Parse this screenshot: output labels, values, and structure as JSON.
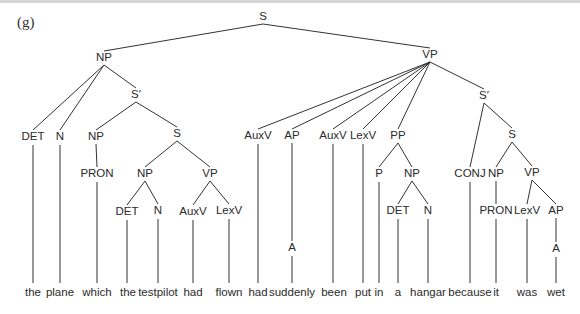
{
  "figure": {
    "label": "(g)",
    "type": "syntax-tree",
    "sentence": "the plane which the testpilot had flown had suddenly been put in a hangar because it was wet"
  },
  "nodes": [
    {
      "id": "S0",
      "label": "S",
      "x": 263,
      "y": 20
    },
    {
      "id": "NP0",
      "label": "NP",
      "x": 104,
      "y": 61
    },
    {
      "id": "VP0",
      "label": "VP",
      "x": 430,
      "y": 58
    },
    {
      "id": "DET0",
      "label": "DET",
      "x": 33,
      "y": 140
    },
    {
      "id": "N0",
      "label": "N",
      "x": 60,
      "y": 140
    },
    {
      "id": "Sb0",
      "label": "S′",
      "x": 136,
      "y": 98
    },
    {
      "id": "NP1",
      "label": "NP",
      "x": 96,
      "y": 140
    },
    {
      "id": "PRON0",
      "label": "PRON",
      "x": 97,
      "y": 177
    },
    {
      "id": "S1",
      "label": "S",
      "x": 177,
      "y": 137
    },
    {
      "id": "NP2",
      "label": "NP",
      "x": 145,
      "y": 177
    },
    {
      "id": "VP1",
      "label": "VP",
      "x": 210,
      "y": 177
    },
    {
      "id": "DET1",
      "label": "DET",
      "x": 127,
      "y": 215
    },
    {
      "id": "N1",
      "label": "N",
      "x": 158,
      "y": 214
    },
    {
      "id": "AuxV0",
      "label": "AuxV",
      "x": 193,
      "y": 215
    },
    {
      "id": "LexV0",
      "label": "LexV",
      "x": 229,
      "y": 214
    },
    {
      "id": "AuxV1",
      "label": "AuxV",
      "x": 258,
      "y": 139
    },
    {
      "id": "AP0",
      "label": "AP",
      "x": 292,
      "y": 139
    },
    {
      "id": "A0",
      "label": "A",
      "x": 292,
      "y": 251
    },
    {
      "id": "AuxV2",
      "label": "AuxV",
      "x": 333,
      "y": 139
    },
    {
      "id": "LexV1",
      "label": "LexV",
      "x": 363,
      "y": 139
    },
    {
      "id": "PP0",
      "label": "PP",
      "x": 398,
      "y": 139
    },
    {
      "id": "P0",
      "label": "P",
      "x": 379,
      "y": 177
    },
    {
      "id": "NP3",
      "label": "NP",
      "x": 412,
      "y": 177
    },
    {
      "id": "DET2",
      "label": "DET",
      "x": 398,
      "y": 214
    },
    {
      "id": "N2",
      "label": "N",
      "x": 428,
      "y": 214
    },
    {
      "id": "Sb1",
      "label": "S′",
      "x": 484,
      "y": 99
    },
    {
      "id": "S2",
      "label": "S",
      "x": 512,
      "y": 138
    },
    {
      "id": "CONJ0",
      "label": "CONJ",
      "x": 470,
      "y": 177
    },
    {
      "id": "NP4",
      "label": "NP",
      "x": 496,
      "y": 177
    },
    {
      "id": "PRON1",
      "label": "PRON",
      "x": 496,
      "y": 214
    },
    {
      "id": "VP2",
      "label": "VP",
      "x": 532,
      "y": 176
    },
    {
      "id": "LexV2",
      "label": "LexV",
      "x": 527,
      "y": 214
    },
    {
      "id": "AP1",
      "label": "AP",
      "x": 556,
      "y": 214
    },
    {
      "id": "A1",
      "label": "A",
      "x": 556,
      "y": 252
    }
  ],
  "words": [
    {
      "text": "the",
      "x": 33
    },
    {
      "text": "plane",
      "x": 60
    },
    {
      "text": "which",
      "x": 97
    },
    {
      "text": "the",
      "x": 128
    },
    {
      "text": "testpilot",
      "x": 158
    },
    {
      "text": "had",
      "x": 193
    },
    {
      "text": "flown",
      "x": 229
    },
    {
      "text": "had",
      "x": 258
    },
    {
      "text": "suddenly",
      "x": 292
    },
    {
      "text": "been",
      "x": 334
    },
    {
      "text": "put",
      "x": 363
    },
    {
      "text": "in",
      "x": 379
    },
    {
      "text": "a",
      "x": 398
    },
    {
      "text": "hangar",
      "x": 428
    },
    {
      "text": "because",
      "x": 470
    },
    {
      "text": "it",
      "x": 496
    },
    {
      "text": "was",
      "x": 527
    },
    {
      "text": "wet",
      "x": 556
    }
  ],
  "word_y": 296
}
